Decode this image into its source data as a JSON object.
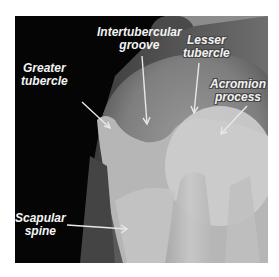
{
  "image": {
    "subject": "shoulder radiograph",
    "colors": {
      "background": "#050505",
      "bone_light": "#cfcfcf",
      "soft_tissue": "#8a8a8a",
      "label_text": "#f4f4f4"
    }
  },
  "labels": {
    "intertubercular_groove": {
      "line1": "Intertubercular",
      "line2": "groove"
    },
    "greater_tubercle": {
      "line1": "Greater",
      "line2": "tubercle"
    },
    "lesser_tubercle": {
      "line1": "Lesser",
      "line2": "tubercle"
    },
    "acromion_process": {
      "line1": "Acromion",
      "line2": "process"
    },
    "scapular_spine": {
      "line1": "Scapular",
      "line2": "spine"
    }
  }
}
